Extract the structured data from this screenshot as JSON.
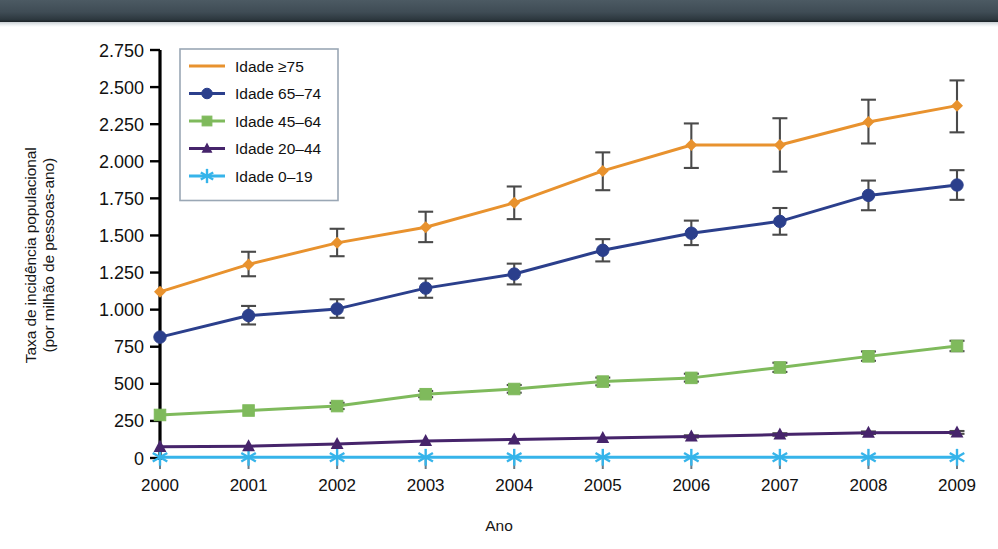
{
  "figure": {
    "y_axis_title_line1": "Taxa de incidência populacional",
    "y_axis_title_line2": "(por milhão de pessoas-ano)",
    "x_axis_title": "Ano"
  },
  "chart_data": {
    "type": "line",
    "title": "",
    "xlabel": "Ano",
    "ylabel": "Taxa de incidência populacional (por milhão de pessoas-ano)",
    "categories": [
      "2000",
      "2001",
      "2002",
      "2003",
      "2004",
      "2005",
      "2006",
      "2007",
      "2008",
      "2009"
    ],
    "x": [
      2000,
      2001,
      2002,
      2003,
      2004,
      2005,
      2006,
      2007,
      2008,
      2009
    ],
    "xlim": [
      2000,
      2009
    ],
    "ylim": [
      0,
      2750
    ],
    "ytick_labels": [
      "0",
      "250",
      "500",
      "750",
      "1.000",
      "1.250",
      "1.500",
      "1.750",
      "2.000",
      "2.250",
      "2.500",
      "2.750"
    ],
    "ytick_values": [
      0,
      250,
      500,
      750,
      1000,
      1250,
      1500,
      1750,
      2000,
      2250,
      2500,
      2750
    ],
    "grid": false,
    "legend_position": "top-left",
    "series": [
      {
        "name": "Idade ≥75",
        "color": "#E8922E",
        "marker": "diamond",
        "values": [
          1120,
          1305,
          1450,
          1555,
          1720,
          1935,
          2110,
          2110,
          2265,
          2375
        ],
        "err_low": [
          1120,
          1225,
          1360,
          1455,
          1610,
          1805,
          1955,
          1930,
          2120,
          2195
        ],
        "err_high": [
          1120,
          1390,
          1545,
          1660,
          1830,
          2060,
          2255,
          2290,
          2415,
          2545
        ]
      },
      {
        "name": "Idade 65–74",
        "color": "#2B3F8C",
        "marker": "circle",
        "values": [
          815,
          960,
          1005,
          1145,
          1240,
          1400,
          1515,
          1595,
          1770,
          1840
        ],
        "err_low": [
          815,
          900,
          945,
          1080,
          1170,
          1325,
          1435,
          1505,
          1670,
          1740
        ],
        "err_high": [
          815,
          1025,
          1070,
          1210,
          1310,
          1475,
          1600,
          1685,
          1870,
          1940
        ]
      },
      {
        "name": "Idade 45–64",
        "color": "#7FBA5C",
        "marker": "square",
        "values": [
          290,
          320,
          350,
          430,
          465,
          515,
          540,
          610,
          685,
          755
        ],
        "err_low": [
          290,
          320,
          330,
          410,
          440,
          490,
          515,
          580,
          655,
          720
        ],
        "err_high": [
          290,
          320,
          372,
          452,
          492,
          542,
          568,
          642,
          718,
          790
        ]
      },
      {
        "name": "Idade 20–44",
        "color": "#46246B",
        "marker": "triangle",
        "values": [
          75,
          80,
          95,
          115,
          125,
          135,
          145,
          158,
          170,
          172
        ],
        "err_low": [
          75,
          80,
          95,
          115,
          125,
          135,
          138,
          150,
          162,
          163
        ],
        "err_high": [
          75,
          80,
          95,
          115,
          125,
          135,
          153,
          167,
          179,
          182
        ]
      },
      {
        "name": "Idade 0–19",
        "color": "#36B4EA",
        "marker": "asterisk",
        "values": [
          5,
          5,
          5,
          5,
          5,
          5,
          5,
          5,
          5,
          5
        ],
        "err_low": [
          5,
          5,
          5,
          5,
          5,
          5,
          5,
          5,
          5,
          5
        ],
        "err_high": [
          5,
          5,
          5,
          5,
          5,
          5,
          5,
          5,
          5,
          5
        ]
      }
    ]
  },
  "legend": {
    "items": [
      {
        "label": "Idade ≥75"
      },
      {
        "label": "Idade 65–74"
      },
      {
        "label": "Idade 45–64"
      },
      {
        "label": "Idade 20–44"
      },
      {
        "label": "Idade 0–19"
      }
    ]
  }
}
